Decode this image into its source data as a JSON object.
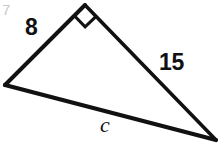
{
  "figure": {
    "kind": "right-triangle-diagram",
    "background_color": "#ffffff",
    "stroke_color": "#111111",
    "artifact_color": "#c9c9c9",
    "corner_artifact_text": "7",
    "labels": {
      "leg_a": "8",
      "leg_b": "15",
      "hypotenuse": "c"
    },
    "vertices": {
      "left": {
        "x": 5,
        "y": 85
      },
      "apex": {
        "x": 85,
        "y": 5
      },
      "bottom_right": {
        "x": 216,
        "y": 140
      }
    },
    "right_angle": {
      "at_vertex": "apex",
      "marker": "square",
      "size": 15
    },
    "sides": [
      {
        "name": "leg-a",
        "label": "8",
        "from": "left",
        "to": "apex",
        "stroke_width": 4
      },
      {
        "name": "leg-b",
        "label": "15",
        "from": "apex",
        "to": "bottom_right",
        "stroke_width": 3.6
      },
      {
        "name": "hypotenuse",
        "label": "c",
        "from": "left",
        "to": "bottom_right",
        "stroke_width": 4.2
      }
    ]
  }
}
